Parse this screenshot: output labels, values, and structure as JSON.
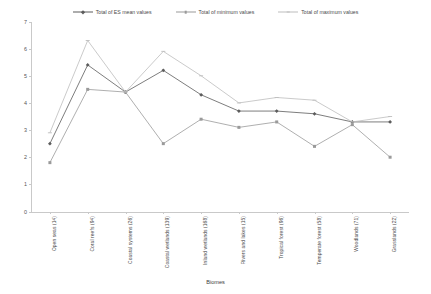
{
  "chart_data": {
    "type": "line",
    "title": "",
    "xlabel": "Biomes",
    "ylabel": "",
    "ylim": [
      0,
      7
    ],
    "ytick_values": [
      0,
      1,
      2,
      3,
      4,
      5,
      6,
      7
    ],
    "ytick_labels": [
      "0",
      "1",
      "2",
      "3",
      "4",
      "5",
      "6",
      "7"
    ],
    "grid": false,
    "legend_position": "top-center",
    "categories": [
      "Open seas (14)",
      "Coral reefs (94)",
      "Coastal systems (26)",
      "Coastal wetlands (139)",
      "Inland wetlands (168)",
      "Rivers and lakes (15)",
      "Tropical forest (96)",
      "Temperate forest (58)",
      "Woodlands (71)",
      "Grasslands (22)"
    ],
    "series": [
      {
        "name": "Total of ES mean values",
        "color": "#5c5c5c",
        "marker": "diamond",
        "values": [
          2.5,
          5.4,
          4.4,
          5.2,
          4.3,
          3.7,
          3.7,
          3.6,
          3.3,
          3.3
        ]
      },
      {
        "name": "Total of minimum values",
        "color": "#9a9a9a",
        "marker": "square",
        "values": [
          1.8,
          4.5,
          4.4,
          2.5,
          3.4,
          3.1,
          3.3,
          2.4,
          3.2,
          2.0
        ]
      },
      {
        "name": "Total of maximum values",
        "color": "#bdbdbd",
        "marker": "cross",
        "values": [
          2.9,
          6.3,
          4.4,
          5.9,
          5.0,
          4.0,
          4.2,
          4.1,
          3.3,
          3.5
        ]
      }
    ]
  },
  "legend": {
    "entries": [
      "Total of ES mean values",
      "Total of minimum values",
      "Total of maximum values"
    ]
  },
  "axis": {
    "x_title": "Biomes"
  }
}
